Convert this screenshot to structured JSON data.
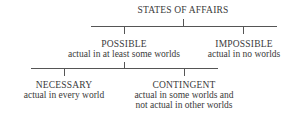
{
  "diagram": {
    "root": {
      "title": "STATES OF AFFAIRS"
    },
    "possible": {
      "title": "POSSIBLE",
      "desc": "actual in at least some worlds"
    },
    "impossible": {
      "title": "IMPOSSIBLE",
      "desc": "actual in no worlds"
    },
    "necessary": {
      "title": "NECESSARY",
      "desc": "actual in every world"
    },
    "contingent": {
      "title": "CONTINGENT",
      "desc_line1": "actual in some worlds and",
      "desc_line2": "not actual in other worlds"
    }
  }
}
